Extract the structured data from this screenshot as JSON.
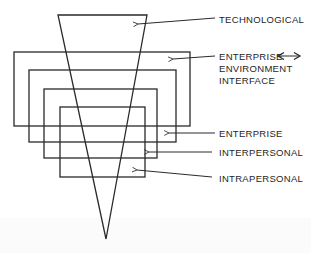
{
  "diagram": {
    "type": "nested-levels-with-funnel",
    "labels": {
      "technological": "TECHNOLOGICAL",
      "enterprise_environment_interface": [
        "ENTERPRISE",
        "ENVIRONMENT",
        "INTERFACE"
      ],
      "enterprise": "ENTERPRISE",
      "interpersonal": "INTERPERSONAL",
      "intrapersonal": "INTRAPERSONAL"
    },
    "bidirectional_arrow_symbol": "↔",
    "nesting_order_outer_to_inner": [
      "Enterprise Environment Interface",
      "Enterprise",
      "Interpersonal",
      "Intrapersonal"
    ],
    "funnel_represents": "Technological",
    "stroke_color": "#2a2a2a"
  }
}
